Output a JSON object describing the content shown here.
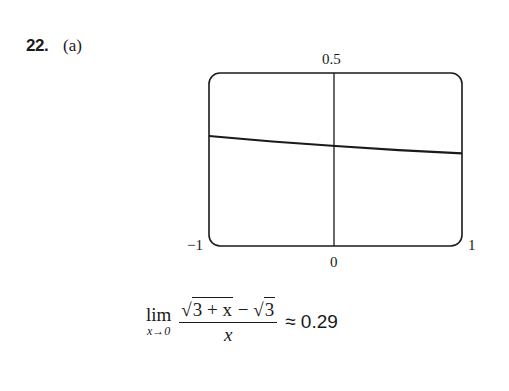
{
  "problem": {
    "number": "22.",
    "part": "(a)"
  },
  "chart_data": {
    "type": "line",
    "title": "",
    "function": "(sqrt(3+x) - sqrt(3)) / x",
    "x": [
      -1,
      -0.5,
      0,
      0.5,
      1
    ],
    "series": [
      {
        "name": "f(x)",
        "values": [
          0.318,
          0.302,
          0.289,
          0.277,
          0.268
        ]
      }
    ],
    "xlim": [
      -1,
      1
    ],
    "ylim": [
      0,
      0.5
    ],
    "tick_labels": {
      "x_left": "−1",
      "x_right": "1",
      "x_zero": "0",
      "y_top": "0.5"
    },
    "xlabel": "",
    "ylabel": "",
    "grid": false,
    "legend": "none"
  },
  "formula": {
    "lim_word": "lim",
    "lim_sub": "x→0",
    "numerator_sqrt1": "3 + x",
    "minus": " − ",
    "numerator_sqrt2": "3",
    "denominator": "x",
    "approx": "≈ 0.29"
  }
}
